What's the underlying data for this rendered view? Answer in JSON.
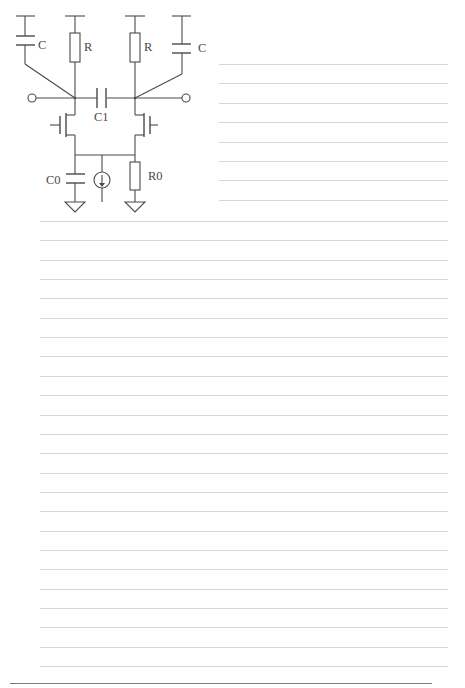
{
  "diagram": {
    "title": "",
    "type": "circuit-schematic",
    "labels": {
      "c_left": "C",
      "r_left": "R",
      "r_right": "R",
      "c_right": "C",
      "c1": "C1",
      "c0": "C0",
      "r0": "R0"
    },
    "components": [
      {
        "id": "c_left",
        "kind": "capacitor",
        "label": "C"
      },
      {
        "id": "r_left",
        "kind": "resistor",
        "label": "R"
      },
      {
        "id": "r_right",
        "kind": "resistor",
        "label": "R"
      },
      {
        "id": "c_right",
        "kind": "capacitor",
        "label": "C"
      },
      {
        "id": "c1",
        "kind": "capacitor",
        "label": "C1"
      },
      {
        "id": "m_left",
        "kind": "transistor",
        "label": ""
      },
      {
        "id": "m_right",
        "kind": "transistor",
        "label": ""
      },
      {
        "id": "c0",
        "kind": "capacitor",
        "label": "C0"
      },
      {
        "id": "i_source",
        "kind": "current-source",
        "label": ""
      },
      {
        "id": "r0",
        "kind": "resistor",
        "label": "R0"
      },
      {
        "id": "gnd_left",
        "kind": "ground",
        "label": ""
      },
      {
        "id": "gnd_right",
        "kind": "ground",
        "label": ""
      },
      {
        "id": "term_left",
        "kind": "terminal",
        "label": ""
      },
      {
        "id": "term_right",
        "kind": "terminal",
        "label": ""
      }
    ]
  },
  "page": {
    "ruled_lines_short": {
      "count": 8,
      "x_start": 219,
      "x_end": 448,
      "y_start": 64,
      "spacing": 19.4
    },
    "ruled_lines_full": {
      "count": 24,
      "x_start": 40,
      "x_end": 448,
      "y_start": 221,
      "spacing": 19.35
    },
    "bottom_rule": {
      "x_start": 10,
      "x_end": 432,
      "y": 683
    },
    "colors": {
      "line": "#d6d6d6",
      "ink": "#4a4a4a",
      "bottom_rule": "#7a7a7a",
      "background": "#ffffff"
    }
  }
}
